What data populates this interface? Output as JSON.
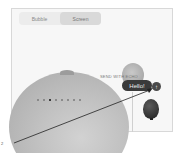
{
  "segmented_control": {
    "tabs": [
      {
        "label": "Bubble",
        "active": false
      },
      {
        "label": "Screen",
        "active": true
      }
    ]
  },
  "effect_preview": {
    "page_dots": {
      "count": 8,
      "active_index": 2
    },
    "send_with_label": "SEND WITH ECHO",
    "message_text": "Hello!",
    "send_button_icon": "arrow-up-icon"
  },
  "annotation": {
    "callout_label": "2"
  },
  "colors": {
    "frame_border": "#d8d8d8",
    "bubble_bg": "#3a3a3a",
    "active_dot": "#111111"
  }
}
